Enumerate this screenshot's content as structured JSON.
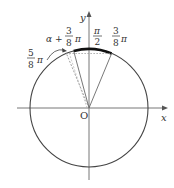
{
  "diagram": {
    "type": "unit-circle",
    "axes": {
      "x_label": "x",
      "y_label": "y",
      "origin_label": "O"
    },
    "labels": {
      "pi_half": {
        "num": "π",
        "den": "2"
      },
      "three_eighths": {
        "num": "3",
        "den": "8",
        "suffix": "π"
      },
      "five_eighths": {
        "num": "5",
        "den": "8",
        "suffix": "π"
      },
      "alpha_plus": {
        "prefix": "α +",
        "num": "3",
        "den": "8",
        "suffix": "π"
      }
    },
    "colors": {
      "line": "#333333",
      "dashed": "#888888",
      "axis": "#777777"
    }
  }
}
